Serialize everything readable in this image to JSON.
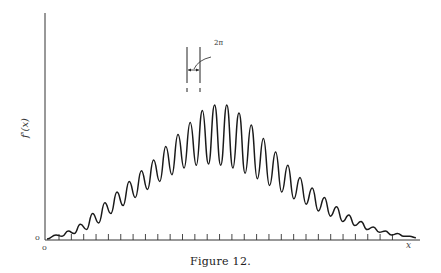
{
  "figure": {
    "caption": "Figure 12.",
    "y_axis_label": "f'(x)",
    "x_axis_label": "x",
    "origin_labels": [
      "o",
      "o"
    ],
    "annotation": "2π",
    "colors": {
      "ink": "#1a1a1a",
      "background": "#ffffff"
    }
  },
  "chart_data": {
    "type": "line",
    "title": "Figure 12.",
    "xlabel": "x",
    "ylabel": "f'(x)",
    "grid": false,
    "legend": null,
    "annotations": [
      {
        "text": "2π",
        "description": "spacing between two adjacent central peaks marked with vertical guide lines and double-headed arrow"
      }
    ],
    "x_ticks_count": 28,
    "oscillation_period": "2π",
    "peaks_relative_height": [
      0.03,
      0.06,
      0.11,
      0.19,
      0.27,
      0.35,
      0.43,
      0.51,
      0.59,
      0.69,
      0.78,
      0.87,
      0.96,
      1.0,
      1.0,
      0.94,
      0.85,
      0.75,
      0.65,
      0.55,
      0.46,
      0.38,
      0.31,
      0.24,
      0.18,
      0.13,
      0.09,
      0.06,
      0.04,
      0.02
    ],
    "troughs_relative_height": [
      0.02,
      0.04,
      0.07,
      0.12,
      0.19,
      0.25,
      0.31,
      0.37,
      0.43,
      0.48,
      0.53,
      0.55,
      0.56,
      0.55,
      0.53,
      0.49,
      0.45,
      0.4,
      0.35,
      0.3,
      0.26,
      0.21,
      0.17,
      0.13,
      0.1,
      0.07,
      0.05,
      0.03,
      0.02,
      0.01
    ]
  }
}
